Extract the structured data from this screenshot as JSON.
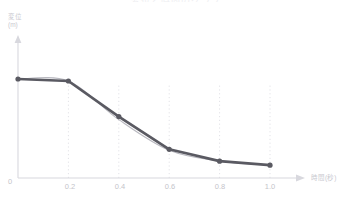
{
  "title": "変位と時間のグラフ",
  "axes": {
    "y_label": "変位",
    "y_unit": "(m)",
    "x_label": "時間(秒)",
    "origin_label": "0"
  },
  "chart_data": {
    "type": "line",
    "title": "変位と時間のグラフ",
    "xlabel": "時間(秒)",
    "ylabel": "変位 (m)",
    "xlim": [
      0,
      1.0
    ],
    "ylim": [
      0,
      1.1
    ],
    "grid": "vertical-dotted",
    "legend": "none",
    "x": [
      0.0,
      0.2,
      0.4,
      0.6,
      0.8,
      1.0
    ],
    "xticklabels": [
      "0",
      "0.2",
      "0.4",
      "0.6",
      "0.8",
      "1.0"
    ],
    "series": [
      {
        "name": "測定値",
        "style": "polyline-with-markers",
        "color": "#5a5a62",
        "values": [
          1.0,
          0.98,
          0.62,
          0.29,
          0.17,
          0.13
        ]
      },
      {
        "name": "近似曲線",
        "style": "smooth-curve",
        "color": "#b9b9c0",
        "values": [
          1.0,
          0.98,
          0.59,
          0.28,
          0.17,
          0.13
        ]
      }
    ]
  },
  "colors": {
    "data_line": "#5a5a62",
    "smooth_curve": "#b9b9c0",
    "axis": "#d8d8de",
    "gridline": "#e2e2e7",
    "tick_text": "#c4c4ca"
  }
}
